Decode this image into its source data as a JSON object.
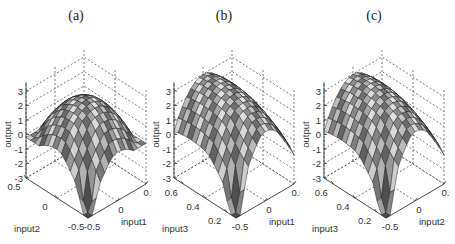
{
  "figure": {
    "panels": [
      {
        "id": "a",
        "title": "(a)",
        "xlabel": "input1",
        "ylabel": "input2",
        "zlabel": "output",
        "x_ticks": [
          "-0.5",
          "0",
          "0.5"
        ],
        "y_ticks": [
          "-0.5",
          "0",
          "0.5"
        ],
        "z_ticks": [
          "3",
          "2",
          "1",
          "0",
          "-1",
          "-2",
          "-3"
        ]
      },
      {
        "id": "b",
        "title": "(b)",
        "xlabel": "input1",
        "ylabel": "input3",
        "zlabel": "output",
        "x_ticks": [
          "-0.5",
          "0",
          "0.5"
        ],
        "y_ticks": [
          "0.2",
          "0.4",
          "0.6"
        ],
        "z_ticks": [
          "3",
          "2",
          "1",
          "0",
          "-1",
          "-2",
          "-3"
        ]
      },
      {
        "id": "c",
        "title": "(c)",
        "xlabel": "input2",
        "ylabel": "input3",
        "zlabel": "output",
        "x_ticks": [
          "-0.5",
          "0",
          "0.5"
        ],
        "y_ticks": [
          "0.2",
          "0.4",
          "0.6"
        ],
        "z_ticks": [
          "3",
          "2",
          "1",
          "0",
          "-1",
          "-2",
          "-3"
        ]
      }
    ]
  },
  "chart_data": [
    {
      "type": "surface",
      "title": "(a)",
      "xlabel": "input1",
      "ylabel": "input2",
      "zlabel": "output",
      "xlim": [
        -0.5,
        0.5
      ],
      "ylim": [
        -0.5,
        0.5
      ],
      "zlim": [
        -3,
        3
      ],
      "x_ticks": [
        -0.5,
        0,
        0.5
      ],
      "y_ticks": [
        -0.5,
        0,
        0.5
      ],
      "z_ticks": [
        -3,
        -2,
        -1,
        0,
        1,
        2,
        3
      ],
      "grid": true,
      "description": "Dome-shaped surface peaking near output≈2.5 at center, edges falling to ≈0 at corners, with sharp spike down to ≈-3 near the front corner",
      "peak": {
        "x": 0,
        "y": 0,
        "z": 2.5
      },
      "corner_values": {
        "x-0.5_y-0.5": -2.5,
        "x0.5_y0.5": 0.5,
        "x-0.5_y0.5": 0,
        "x0.5_y-0.5": 0
      }
    },
    {
      "type": "surface",
      "title": "(b)",
      "xlabel": "input1",
      "ylabel": "input3",
      "zlabel": "output",
      "xlim": [
        -0.5,
        0.5
      ],
      "ylim": [
        0.1,
        0.7
      ],
      "zlim": [
        -3,
        3
      ],
      "x_ticks": [
        -0.5,
        0,
        0.5
      ],
      "y_ticks": [
        0.2,
        0.4,
        0.6
      ],
      "z_ticks": [
        -3,
        -2,
        -1,
        0,
        1,
        2,
        3
      ],
      "grid": true,
      "description": "Ridge-shaped surface peaking near output≈3 along input1≈0, falling to ≈0 at input1 edges, with sharp spike down to ≈-3 near front corner",
      "peak": {
        "x": 0,
        "y": 0.5,
        "z": 3
      },
      "corner_values": {
        "x-0.5_y0.1": -2.5,
        "x0.5_y0.7": 0.5,
        "x-0.5_y0.7": 1,
        "x0.5_y0.1": 0
      }
    },
    {
      "type": "surface",
      "title": "(c)",
      "xlabel": "input2",
      "ylabel": "input3",
      "zlabel": "output",
      "xlim": [
        -0.5,
        0.5
      ],
      "ylim": [
        0.1,
        0.7
      ],
      "zlim": [
        -3,
        3
      ],
      "x_ticks": [
        -0.5,
        0,
        0.5
      ],
      "y_ticks": [
        0.2,
        0.4,
        0.6
      ],
      "z_ticks": [
        -3,
        -2,
        -1,
        0,
        1,
        2,
        3
      ],
      "grid": true,
      "description": "Ridge-shaped surface similar to (b), peak output≈3, sharp spike down to ≈-3 near front corner",
      "peak": {
        "x": 0,
        "y": 0.5,
        "z": 3
      },
      "corner_values": {
        "x-0.5_y0.1": -2.5,
        "x0.5_y0.7": 0.5,
        "x-0.5_y0.7": 1,
        "x0.5_y0.1": 0
      }
    }
  ]
}
